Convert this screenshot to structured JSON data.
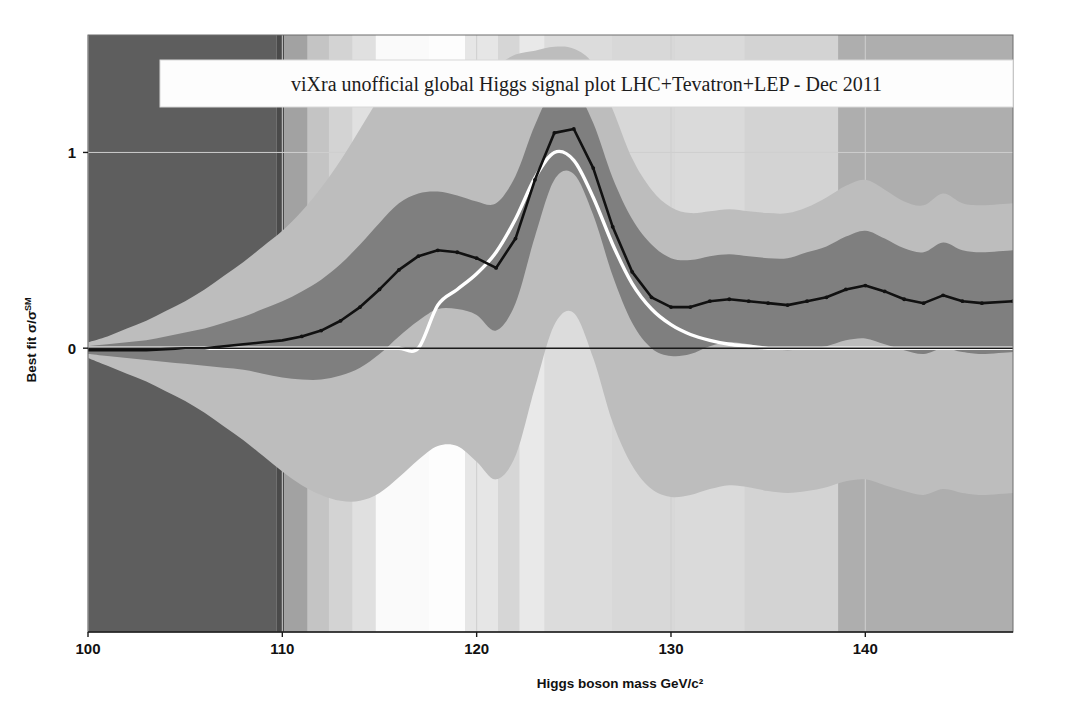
{
  "chart_data": {
    "type": "area",
    "title": "viXra unofficial global Higgs signal plot LHC+Tevatron+LEP - Dec 2011",
    "xlabel": "Higgs boson mass GeV/c²",
    "ylabel": "Best fit σ/σ",
    "ylabel_sup": "SM",
    "xlim": [
      100,
      147.6
    ],
    "ylim": [
      -1.45,
      1.6
    ],
    "xticks": [
      100,
      110,
      120,
      130,
      140
    ],
    "yticks": [
      0,
      1
    ],
    "grid": true,
    "legend": "none",
    "colors": {
      "central_line": "#111111",
      "band_1sigma": "#7f7f7f",
      "band_2sigma": "#bdbdbd",
      "theory_curve": "#ffffff",
      "zero_line": "#1a1a1a",
      "gridline": "#cfcfcf",
      "axis": "#1a1a1a",
      "plot_background": "#d0d0d0",
      "title_box": "#fdfdfd"
    },
    "x": [
      100,
      101,
      102,
      103,
      104,
      105,
      106,
      107,
      108,
      109,
      110,
      111,
      112,
      113,
      114,
      115,
      116,
      117,
      118,
      119,
      120,
      121,
      122,
      123,
      124,
      125,
      126,
      127,
      128,
      129,
      130,
      131,
      132,
      133,
      134,
      135,
      136,
      137,
      138,
      139,
      140,
      141,
      142,
      143,
      144,
      145,
      146,
      147.6
    ],
    "series": [
      {
        "name": "Best fit",
        "role": "central",
        "values": [
          -0.01,
          -0.01,
          -0.01,
          -0.01,
          -0.005,
          0.0,
          0.0,
          0.01,
          0.02,
          0.03,
          0.04,
          0.06,
          0.09,
          0.14,
          0.21,
          0.3,
          0.4,
          0.47,
          0.5,
          0.49,
          0.46,
          0.41,
          0.56,
          0.86,
          1.1,
          1.12,
          0.92,
          0.62,
          0.39,
          0.26,
          0.21,
          0.21,
          0.24,
          0.25,
          0.24,
          0.23,
          0.22,
          0.24,
          0.26,
          0.3,
          0.32,
          0.29,
          0.25,
          0.23,
          0.27,
          0.24,
          0.23,
          0.24
        ]
      },
      {
        "name": "68% CL band upper",
        "role": "band1_upper",
        "values": [
          0.01,
          0.02,
          0.03,
          0.04,
          0.06,
          0.08,
          0.1,
          0.13,
          0.16,
          0.2,
          0.24,
          0.29,
          0.35,
          0.43,
          0.53,
          0.64,
          0.74,
          0.79,
          0.8,
          0.78,
          0.75,
          0.74,
          0.88,
          1.14,
          1.33,
          1.33,
          1.15,
          0.87,
          0.66,
          0.53,
          0.46,
          0.45,
          0.47,
          0.48,
          0.47,
          0.46,
          0.46,
          0.49,
          0.52,
          0.57,
          0.6,
          0.56,
          0.51,
          0.49,
          0.54,
          0.5,
          0.49,
          0.5
        ]
      },
      {
        "name": "68% CL band lower",
        "role": "band1_lower",
        "values": [
          -0.03,
          -0.04,
          -0.05,
          -0.06,
          -0.07,
          -0.08,
          -0.09,
          -0.1,
          -0.11,
          -0.13,
          -0.15,
          -0.16,
          -0.16,
          -0.14,
          -0.1,
          -0.03,
          0.06,
          0.14,
          0.2,
          0.2,
          0.17,
          0.09,
          0.23,
          0.57,
          0.86,
          0.89,
          0.68,
          0.37,
          0.13,
          0.0,
          -0.04,
          -0.03,
          0.01,
          0.03,
          0.02,
          0.0,
          -0.01,
          0.0,
          0.01,
          0.04,
          0.05,
          0.02,
          -0.01,
          -0.03,
          0.0,
          -0.02,
          -0.03,
          -0.02
        ]
      },
      {
        "name": "95% CL band upper",
        "role": "band2_upper",
        "values": [
          0.03,
          0.06,
          0.1,
          0.14,
          0.19,
          0.24,
          0.3,
          0.37,
          0.44,
          0.52,
          0.6,
          0.7,
          0.82,
          0.96,
          1.12,
          1.28,
          1.4,
          1.46,
          1.43,
          1.3,
          1.36,
          1.44,
          1.5,
          1.52,
          1.54,
          1.53,
          1.45,
          1.22,
          0.97,
          0.81,
          0.72,
          0.69,
          0.7,
          0.71,
          0.7,
          0.69,
          0.69,
          0.72,
          0.77,
          0.83,
          0.86,
          0.81,
          0.75,
          0.73,
          0.79,
          0.74,
          0.73,
          0.74
        ]
      },
      {
        "name": "95% CL band lower",
        "role": "band2_lower",
        "values": [
          -0.05,
          -0.09,
          -0.13,
          -0.17,
          -0.22,
          -0.27,
          -0.33,
          -0.4,
          -0.47,
          -0.55,
          -0.63,
          -0.7,
          -0.75,
          -0.78,
          -0.78,
          -0.74,
          -0.66,
          -0.57,
          -0.5,
          -0.5,
          -0.58,
          -0.67,
          -0.55,
          -0.2,
          0.12,
          0.18,
          -0.05,
          -0.38,
          -0.6,
          -0.72,
          -0.76,
          -0.75,
          -0.72,
          -0.7,
          -0.71,
          -0.73,
          -0.74,
          -0.73,
          -0.71,
          -0.68,
          -0.67,
          -0.7,
          -0.73,
          -0.75,
          -0.72,
          -0.74,
          -0.75,
          -0.74
        ]
      },
      {
        "name": "Standard Model expectation",
        "role": "theory",
        "values": [
          0.0,
          0.0,
          0.0,
          0.0,
          0.0,
          0.0,
          0.0,
          0.0,
          0.0,
          0.0,
          0.0,
          0.0,
          0.0,
          0.0,
          0.0,
          0.0,
          0.0,
          0.0,
          0.22,
          0.3,
          0.38,
          0.49,
          0.66,
          0.87,
          1.0,
          0.96,
          0.77,
          0.53,
          0.33,
          0.2,
          0.12,
          0.07,
          0.04,
          0.02,
          0.01,
          0.0,
          0.0,
          0.0,
          0.0,
          0.0,
          0.0,
          0.0,
          0.0,
          0.0,
          0.0,
          0.0,
          0.0,
          0.0
        ]
      }
    ],
    "background_bands": [
      {
        "from": 100.0,
        "to": 109.7,
        "shade": "#5e5e5e"
      },
      {
        "from": 109.7,
        "to": 110.1,
        "shade": "#4a4a4a"
      },
      {
        "from": 110.1,
        "to": 111.3,
        "shade": "#a2a2a2"
      },
      {
        "from": 111.3,
        "to": 112.4,
        "shade": "#c4c4c4"
      },
      {
        "from": 112.4,
        "to": 113.6,
        "shade": "#d3d3d3"
      },
      {
        "from": 113.6,
        "to": 114.8,
        "shade": "#e0e0e0"
      },
      {
        "from": 114.8,
        "to": 117.5,
        "shade": "#fafafa"
      },
      {
        "from": 117.5,
        "to": 119.4,
        "shade": "#fdfdfd"
      },
      {
        "from": 119.4,
        "to": 121.1,
        "shade": "#e6e6e6"
      },
      {
        "from": 121.1,
        "to": 122.2,
        "shade": "#d6d6d6"
      },
      {
        "from": 122.2,
        "to": 123.5,
        "shade": "#e9e9e9"
      },
      {
        "from": 123.5,
        "to": 127.0,
        "shade": "#dcdcdc"
      },
      {
        "from": 127.0,
        "to": 130.2,
        "shade": "#d8d8d8"
      },
      {
        "from": 130.2,
        "to": 133.8,
        "shade": "#dadada"
      },
      {
        "from": 133.8,
        "to": 138.6,
        "shade": "#d3d3d3"
      },
      {
        "from": 138.6,
        "to": 147.6,
        "shade": "#aeaeae"
      }
    ]
  }
}
